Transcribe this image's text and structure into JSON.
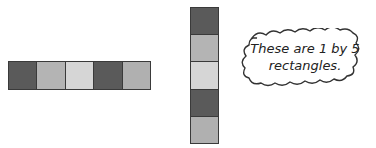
{
  "horizontal_rectangle": {
    "label": "1 by 5 rectangle (horizontal)",
    "cells": [
      {
        "shade": "dark",
        "color": "#5a5a5a"
      },
      {
        "shade": "medium",
        "color": "#b4b4b4"
      },
      {
        "shade": "light",
        "color": "#d6d6d6"
      },
      {
        "shade": "dark",
        "color": "#5a5a5a"
      },
      {
        "shade": "medium",
        "color": "#b0b0b0"
      }
    ]
  },
  "vertical_rectangle": {
    "label": "1 by 5 rectangle (vertical)",
    "cells": [
      {
        "shade": "dark",
        "color": "#5a5a5a"
      },
      {
        "shade": "medium",
        "color": "#b4b4b4"
      },
      {
        "shade": "light",
        "color": "#d6d6d6"
      },
      {
        "shade": "dark",
        "color": "#5a5a5a"
      },
      {
        "shade": "medium",
        "color": "#b0b0b0"
      }
    ]
  },
  "callout": {
    "line1": "These are 1 by 5",
    "line2": "rectangles."
  }
}
